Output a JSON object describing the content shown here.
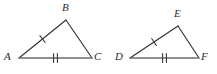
{
  "figure": {
    "background_color": "#ffffff",
    "stroke_color": "#2e2e2e",
    "base_stroke_color": "#6e6e6e",
    "tick_color": "#3a3a3a",
    "label_color": "#2b2b2b",
    "stroke_width": 1.1,
    "triangles": [
      {
        "name": "triangle-abc",
        "vertices": [
          {
            "label": "A",
            "x": 19,
            "y": 58,
            "label_x": 4,
            "label_y": 52
          },
          {
            "label": "B",
            "x": 66,
            "y": 20,
            "label_x": 62,
            "label_y": 3
          },
          {
            "label": "C",
            "x": 92,
            "y": 58,
            "label_x": 95,
            "label_y": 52
          }
        ],
        "sides": [
          {
            "name": "side-ab",
            "from": "A",
            "to": "B",
            "ticks": 1
          },
          {
            "name": "side-bc",
            "from": "B",
            "to": "C",
            "ticks": 0
          },
          {
            "name": "side-ac",
            "from": "A",
            "to": "C",
            "ticks": 2
          }
        ]
      },
      {
        "name": "triangle-def",
        "vertices": [
          {
            "label": "D",
            "x": 130,
            "y": 58,
            "label_x": 115,
            "label_y": 52
          },
          {
            "label": "E",
            "x": 178,
            "y": 26,
            "label_x": 174,
            "label_y": 9
          },
          {
            "label": "F",
            "x": 199,
            "y": 58,
            "label_x": 202,
            "label_y": 52
          }
        ],
        "sides": [
          {
            "name": "side-de",
            "from": "D",
            "to": "E",
            "ticks": 1
          },
          {
            "name": "side-ef",
            "from": "E",
            "to": "F",
            "ticks": 0
          },
          {
            "name": "side-df",
            "from": "D",
            "to": "F",
            "ticks": 2
          }
        ]
      }
    ],
    "labels": {
      "a": "A",
      "b": "B",
      "c": "C",
      "d": "D",
      "e": "E",
      "f": "F"
    }
  }
}
